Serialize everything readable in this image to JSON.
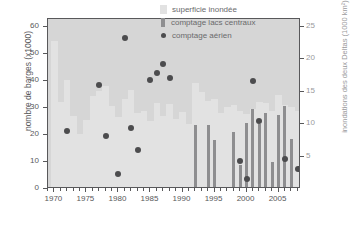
{
  "chart_data": {
    "type": "bar",
    "title": "",
    "xlabel": "",
    "ylabel": "nombre de barges (x1000)",
    "ylabel_right": "inondations des deux Deltas (1000 km²)",
    "xlim": [
      1969.0,
      2008.5
    ],
    "ylim": [
      0,
      63
    ],
    "ylim_right": [
      0,
      26.25
    ],
    "grid": false,
    "legend_position": "top-right",
    "xticks": [
      1970,
      1975,
      1980,
      1985,
      1990,
      1995,
      2000,
      2005
    ],
    "xtick_labels": [
      "1970",
      "1975",
      "1980",
      "1985",
      "1990",
      "1995",
      "2000",
      "2005"
    ],
    "xticks_minor_step": 1,
    "yticks_left": [
      0,
      10,
      20,
      30,
      40,
      50,
      60
    ],
    "ytick_labels_left": [
      "0",
      "10",
      "20",
      "30",
      "40",
      "50",
      "60"
    ],
    "yticks_right": [
      5,
      10,
      15,
      20,
      25
    ],
    "ytick_labels_right": [
      "5",
      "10",
      "15",
      "20",
      "25"
    ],
    "x": [
      1970,
      1971,
      1972,
      1973,
      1974,
      1975,
      1976,
      1977,
      1978,
      1979,
      1980,
      1981,
      1982,
      1983,
      1984,
      1985,
      1986,
      1987,
      1988,
      1989,
      1990,
      1991,
      1992,
      1993,
      1994,
      1995,
      1996,
      1997,
      1998,
      1999,
      2000,
      2001,
      2002,
      2003,
      2004,
      2005,
      2006,
      2007,
      2008
    ],
    "series": [
      {
        "name": "superficie inondée",
        "type": "bar",
        "axis": "right",
        "color": "#e2e2e2",
        "values": [
          22.5,
          13.2,
          16.5,
          11.0,
          8.2,
          10.3,
          14.0,
          14.8,
          15.6,
          12.5,
          10.8,
          13.6,
          15.0,
          11.5,
          11.8,
          10.2,
          13.0,
          11.0,
          12.8,
          10.5,
          11.6,
          9.8,
          16.0,
          14.6,
          13.3,
          13.6,
          11.4,
          12.3,
          12.7,
          11.8,
          11.2,
          12.0,
          13.2,
          12.9,
          11.8,
          14.2,
          12.6,
          12.3,
          11.7
        ]
      },
      {
        "name": "comptage lacs centraux",
        "type": "bar",
        "axis": "right",
        "color": "#8e8e90",
        "values": [
          null,
          null,
          null,
          null,
          null,
          null,
          null,
          null,
          null,
          null,
          null,
          null,
          null,
          null,
          null,
          null,
          null,
          null,
          null,
          null,
          null,
          null,
          9.6,
          null,
          9.5,
          7.2,
          null,
          null,
          8.5,
          3.4,
          9.9,
          12.1,
          9.7,
          11.5,
          3.9,
          11.1,
          12.5,
          7.4,
          null
        ]
      },
      {
        "name": "comptage aérien",
        "type": "scatter",
        "axis": "left",
        "color": "#4c4c4e",
        "points": [
          {
            "x": 1972,
            "y": 20.8
          },
          {
            "x": 1977,
            "y": 37.8
          },
          {
            "x": 1978,
            "y": 18.9
          },
          {
            "x": 1980,
            "y": 4.7
          },
          {
            "x": 1981,
            "y": 55.4
          },
          {
            "x": 1982,
            "y": 21.8
          },
          {
            "x": 1983,
            "y": 13.8
          },
          {
            "x": 1985,
            "y": 39.8
          },
          {
            "x": 1986,
            "y": 42.4
          },
          {
            "x": 1987,
            "y": 45.5
          },
          {
            "x": 1988,
            "y": 40.5
          },
          {
            "x": 1999,
            "y": 9.6
          },
          {
            "x": 2000,
            "y": 2.9
          },
          {
            "x": 2001,
            "y": 39.4
          },
          {
            "x": 2002,
            "y": 24.5
          },
          {
            "x": 2006,
            "y": 10.4
          },
          {
            "x": 2008,
            "y": 6.8
          }
        ]
      }
    ],
    "legend": [
      {
        "label": "superficie inondée",
        "marker": "square",
        "color": "#e2e2e2"
      },
      {
        "label": "comptage lacs centraux",
        "marker": "bar",
        "color": "#8e8e90"
      },
      {
        "label": "comptage aérien",
        "marker": "circle",
        "color": "#4c4c4e"
      }
    ]
  }
}
